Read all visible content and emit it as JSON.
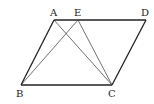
{
  "diagram": {
    "type": "geometry",
    "shape": "parallelogram ABCD",
    "points": {
      "A": {
        "label": "A",
        "x": 54,
        "y": 20
      },
      "E": {
        "label": "E",
        "x": 78,
        "y": 20
      },
      "D": {
        "label": "D",
        "x": 146,
        "y": 20
      },
      "B": {
        "label": "B",
        "x": 21,
        "y": 85
      },
      "C": {
        "label": "C",
        "x": 112,
        "y": 85
      }
    },
    "edges": [
      "AB",
      "AD",
      "BC",
      "CD"
    ],
    "segments": [
      "AC",
      "BE",
      "EC"
    ]
  }
}
